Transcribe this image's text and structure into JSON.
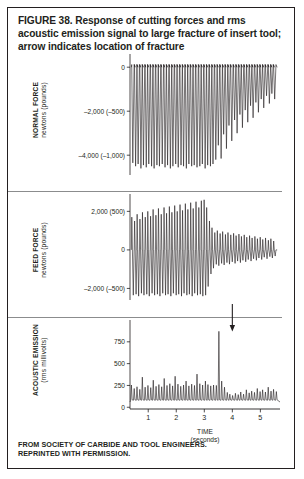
{
  "figure": {
    "caption": "FIGURE 38. Response of cutting forces and rms acoustic emission signal to large fracture of insert tool; arrow indicates location of fracture",
    "credit_line_1": "FROM SOCIETY OF CARBIDE AND TOOL ENGINEERS.",
    "credit_line_2": "REPRINTED WITH PERMISSION.",
    "border_color": "#231f20",
    "trace_color": "#231f20"
  },
  "xaxis": {
    "label_line_1": "TIME",
    "label_line_2": "(seconds)",
    "ticks": [
      "1",
      "2",
      "3",
      "4",
      "5"
    ],
    "tick_values": [
      1,
      2,
      3,
      4,
      5
    ],
    "range": [
      0.35,
      5.7
    ]
  },
  "annotation": {
    "arrow_name": "fracture-arrow",
    "arrow_time": 4.0,
    "meaning": "location of fracture"
  },
  "panels": [
    {
      "id": "normal-force",
      "axis_label_line_1": "NORMAL FORCE",
      "axis_label_line_2": "newtons (pounds)",
      "ticks": [
        {
          "label": "0",
          "value": 0
        },
        {
          "label": "–2,000 (–500)",
          "value": -2000
        },
        {
          "label": "–4,000 (–1,000)",
          "value": -4000
        }
      ],
      "ylim": [
        -4900,
        600
      ]
    },
    {
      "id": "feed-force",
      "axis_label_line_1": "FEED FORCE",
      "axis_label_line_2": "newtons (pounds)",
      "ticks": [
        {
          "label": "2,000 (500)",
          "value": 2000
        },
        {
          "label": "0",
          "value": 0
        },
        {
          "label": "–2,000 (–500)",
          "value": -2000
        }
      ],
      "ylim": [
        -2600,
        2900
      ]
    },
    {
      "id": "acoustic-emission",
      "axis_label_line_1": "ACOUSTIC EMISSION",
      "axis_label_line_2": "(rms millivolts)",
      "ticks": [
        {
          "label": "750",
          "value": 750
        },
        {
          "label": "500",
          "value": 500
        },
        {
          "label": "250",
          "value": 250
        },
        {
          "label": "0",
          "value": 0
        }
      ],
      "ylim": [
        -20,
        1000
      ]
    }
  ],
  "chart_data": {
    "type": "line",
    "title": "Response of cutting forces and rms acoustic emission signal to large fracture of insert tool",
    "xlabel": "TIME (seconds)",
    "x_range": [
      0.35,
      5.7
    ],
    "x_ticks": [
      1,
      2,
      3,
      4,
      5
    ],
    "grid": false,
    "legend": "none",
    "fracture_time": 4.0,
    "panels": [
      {
        "name": "NORMAL FORCE",
        "ylabel": "newtons (pounds)",
        "ylim": [
          -4900,
          600
        ],
        "y_ticks": [
          0,
          -2000,
          -4000
        ],
        "y_tick_labels": [
          "0",
          "–2,000 (–500)",
          "–4,000 (–1,000)"
        ],
        "description": "Baseline near 0 with regular downward cutting spikes; amplitude is large and steady before the fracture then decays sharply after it.",
        "baseline": 0,
        "spike_direction": "down",
        "spike_period": 0.096,
        "spike_times": [
          0.45,
          0.55,
          0.64,
          0.74,
          0.83,
          0.93,
          1.02,
          1.12,
          1.21,
          1.31,
          1.4,
          1.5,
          1.6,
          1.69,
          1.79,
          1.88,
          1.98,
          2.07,
          2.17,
          2.26,
          2.36,
          2.45,
          2.55,
          2.64,
          2.74,
          2.84,
          2.93,
          3.03,
          3.12,
          3.22,
          3.31,
          3.41,
          3.5,
          3.6,
          3.69,
          3.79,
          3.88,
          3.98,
          4.08,
          4.17,
          4.27,
          4.36,
          4.46,
          4.55,
          4.65,
          4.74,
          4.84,
          4.93,
          5.03,
          5.12,
          5.22,
          5.32,
          5.41,
          5.51
        ],
        "spike_amplitudes": [
          -4350,
          -4500,
          -4400,
          -4600,
          -4450,
          -4550,
          -4400,
          -4500,
          -4600,
          -4450,
          -4500,
          -4400,
          -4550,
          -4450,
          -4600,
          -4500,
          -4400,
          -4550,
          -4450,
          -4500,
          -4600,
          -4400,
          -4500,
          -4450,
          -4550,
          -4500,
          -4400,
          -4600,
          -4450,
          -4500,
          -4400,
          -4200,
          -3550,
          -4150,
          -3050,
          -3700,
          -2650,
          -3350,
          -2400,
          -3000,
          -2150,
          -2750,
          -1950,
          -2500,
          -1750,
          -2300,
          -1600,
          -2050,
          -1450,
          -1850,
          -1300,
          -1650,
          -1200,
          -1450
        ]
      },
      {
        "name": "FEED FORCE",
        "ylabel": "newtons (pounds)",
        "ylim": [
          -2600,
          2900
        ],
        "y_ticks": [
          2000,
          0,
          -2000
        ],
        "y_tick_labels": [
          "2,000 (500)",
          "0",
          "–2,000 (–500)"
        ],
        "description": "Bipolar spikes about a zero baseline; upward and downward excursions are large before the fracture at 4 s and much smaller afterwards.",
        "baseline": 0,
        "spike_direction": "both",
        "spike_period": 0.096,
        "spike_times": [
          0.45,
          0.55,
          0.64,
          0.74,
          0.83,
          0.93,
          1.02,
          1.12,
          1.21,
          1.31,
          1.4,
          1.5,
          1.6,
          1.69,
          1.79,
          1.88,
          1.98,
          2.07,
          2.17,
          2.26,
          2.36,
          2.45,
          2.55,
          2.64,
          2.74,
          2.84,
          2.93,
          3.03,
          3.12,
          3.22,
          3.31,
          3.41,
          3.5,
          3.6,
          3.69,
          3.79,
          3.88,
          3.98,
          4.08,
          4.17,
          4.27,
          4.36,
          4.46,
          4.55,
          4.65,
          4.74,
          4.84,
          4.93,
          5.03,
          5.12,
          5.22,
          5.32,
          5.41,
          5.51
        ],
        "spike_up_amplitudes": [
          1700,
          1500,
          1850,
          1600,
          1950,
          1700,
          2000,
          1750,
          2100,
          1800,
          2150,
          1850,
          2200,
          1900,
          2250,
          1950,
          2300,
          2000,
          2350,
          2050,
          2400,
          2100,
          2450,
          2150,
          2500,
          2200,
          2550,
          2600,
          2200,
          1500,
          1150,
          900,
          1000,
          850,
          950,
          800,
          900,
          780,
          860,
          740,
          820,
          700,
          780,
          660,
          740,
          620,
          700,
          580,
          660,
          540,
          620,
          500,
          580,
          460
        ],
        "spike_down_amplitudes": [
          -2350,
          -2300,
          -2400,
          -2250,
          -2350,
          -2300,
          -2400,
          -2250,
          -2350,
          -2300,
          -2400,
          -2250,
          -2350,
          -2300,
          -2400,
          -2250,
          -2350,
          -2300,
          -2400,
          -2250,
          -2350,
          -2300,
          -2400,
          -2250,
          -2350,
          -2300,
          -2400,
          -2350,
          -1900,
          -1250,
          -950,
          -750,
          -820,
          -700,
          -780,
          -660,
          -740,
          -620,
          -700,
          -580,
          -660,
          -540,
          -620,
          -500,
          -580,
          -460,
          -540,
          -420,
          -500,
          -380,
          -460,
          -350,
          -420,
          -320
        ]
      },
      {
        "name": "ACOUSTIC EMISSION",
        "ylabel": "(rms millivolts)",
        "ylim": [
          -20,
          1000
        ],
        "y_ticks": [
          750,
          500,
          250,
          0
        ],
        "y_tick_labels": [
          "750",
          "500",
          "250",
          "0"
        ],
        "description": "Oscillating rms signal around 100-350 mV with one large burst reaching about 870 mV at the 4 s fracture, followed by reduced amplitude.",
        "baseline": 60,
        "peak_value": 870,
        "peak_time": 4.0,
        "oscillation_times": [
          0.4,
          0.5,
          0.6,
          0.7,
          0.79,
          0.89,
          0.99,
          1.09,
          1.18,
          1.28,
          1.38,
          1.48,
          1.57,
          1.67,
          1.77,
          1.87,
          1.96,
          2.06,
          2.16,
          2.26,
          2.35,
          2.45,
          2.55,
          2.65,
          2.74,
          2.84,
          2.94,
          3.04,
          3.13,
          3.23,
          3.33,
          3.43,
          3.52,
          3.62,
          3.72,
          3.82,
          3.91,
          4.01,
          4.11,
          4.21,
          4.3,
          4.4,
          4.5,
          4.6,
          4.69,
          4.79,
          4.89,
          4.99,
          5.08,
          5.18,
          5.28,
          5.38,
          5.47,
          5.57
        ],
        "oscillation_peaks": [
          255,
          215,
          235,
          205,
          345,
          230,
          250,
          225,
          310,
          240,
          260,
          235,
          330,
          250,
          270,
          245,
          355,
          265,
          240,
          255,
          300,
          245,
          265,
          250,
          380,
          270,
          255,
          300,
          260,
          245,
          255,
          250,
          870,
          300,
          230,
          170,
          150,
          135,
          160,
          145,
          175,
          150,
          200,
          165,
          185,
          170,
          215,
          180,
          200,
          175,
          230,
          185,
          205,
          180
        ]
      }
    ]
  }
}
